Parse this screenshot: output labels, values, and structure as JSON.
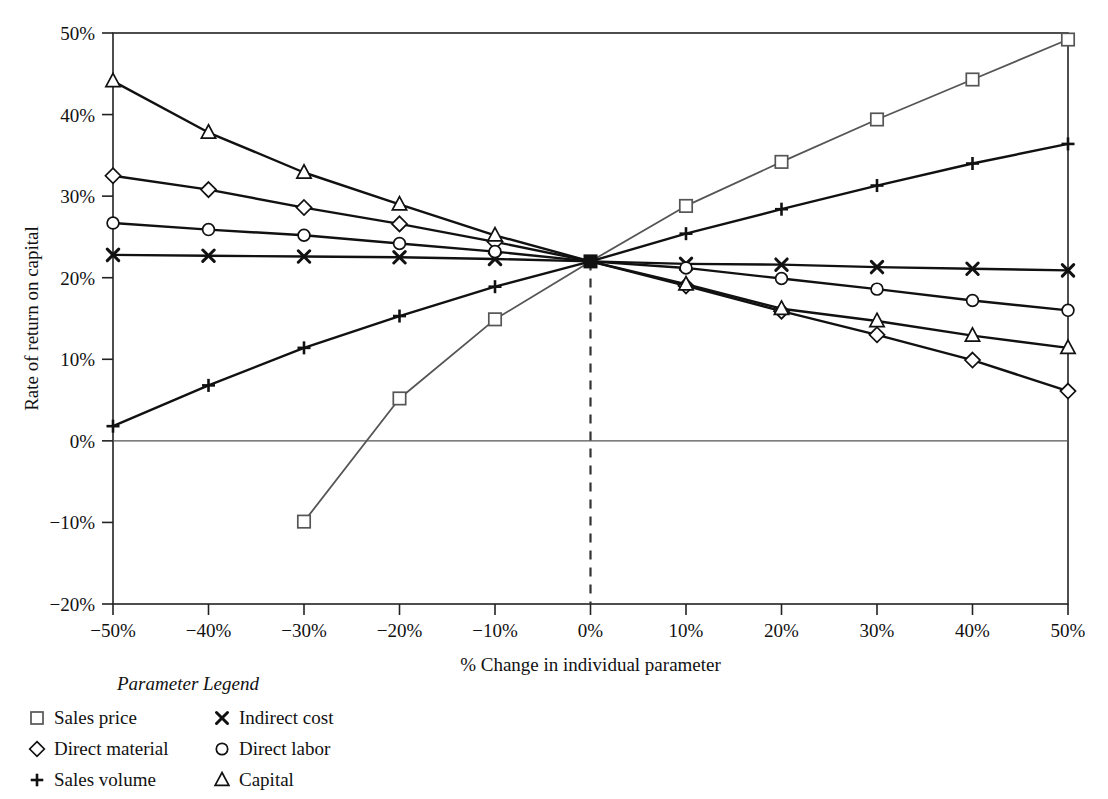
{
  "chart_data": {
    "type": "line",
    "title": "",
    "xlabel": "% Change in individual parameter",
    "ylabel": "Rate of return on capital",
    "x": [
      -50,
      -40,
      -30,
      -20,
      -10,
      0,
      10,
      20,
      30,
      40,
      50
    ],
    "xtick_labels": [
      "−50%",
      "−40%",
      "−30%",
      "−20%",
      "−10%",
      "0%",
      "10%",
      "20%",
      "30%",
      "40%",
      "50%"
    ],
    "ytick_labels": [
      "50%",
      "40%",
      "30%",
      "20%",
      "10%",
      "0%",
      "−10%",
      "−20%"
    ],
    "yticks": [
      50,
      40,
      30,
      20,
      10,
      0,
      -10,
      -20
    ],
    "xlim": [
      -50,
      50
    ],
    "ylim": [
      -20,
      50
    ],
    "grid": false,
    "legend_position": "below-left",
    "annotations": {
      "zero_reference_line_y": 0,
      "base_case_x": 0,
      "base_case_value": 22.0,
      "base_case_marker": "filled-square",
      "vertical_dashed_line_x": 0
    },
    "series": [
      {
        "name": "Sales price",
        "marker": "square",
        "color": "#555555",
        "x": [
          -30,
          -20,
          -10,
          0,
          10,
          20,
          30,
          40,
          50
        ],
        "values": [
          -9.9,
          5.2,
          14.9,
          22.0,
          28.8,
          34.2,
          39.4,
          44.3,
          49.2
        ]
      },
      {
        "name": "Direct material",
        "marker": "diamond",
        "color": "#111111",
        "x": [
          -50,
          -40,
          -30,
          -20,
          -10,
          0,
          10,
          20,
          30,
          40,
          50
        ],
        "values": [
          32.5,
          30.8,
          28.6,
          26.6,
          24.4,
          22.0,
          19.0,
          15.9,
          13.0,
          9.9,
          6.1
        ]
      },
      {
        "name": "Sales volume",
        "marker": "plus",
        "color": "#111111",
        "x": [
          -50,
          -40,
          -30,
          -20,
          -10,
          0,
          10,
          20,
          30,
          40,
          50
        ],
        "values": [
          1.8,
          6.8,
          11.4,
          15.3,
          18.9,
          22.0,
          25.4,
          28.4,
          31.3,
          34.0,
          36.4
        ]
      },
      {
        "name": "Indirect cost",
        "marker": "cross",
        "color": "#111111",
        "x": [
          -50,
          -40,
          -30,
          -20,
          -10,
          0,
          10,
          20,
          30,
          40,
          50
        ],
        "values": [
          22.8,
          22.7,
          22.6,
          22.5,
          22.3,
          22.0,
          21.7,
          21.6,
          21.3,
          21.1,
          20.9
        ]
      },
      {
        "name": "Direct labor",
        "marker": "circle",
        "color": "#111111",
        "x": [
          -50,
          -40,
          -30,
          -20,
          -10,
          0,
          10,
          20,
          30,
          40,
          50
        ],
        "values": [
          26.7,
          25.9,
          25.2,
          24.2,
          23.2,
          22.0,
          21.2,
          19.9,
          18.6,
          17.2,
          16.0
        ]
      },
      {
        "name": "Capital",
        "marker": "triangle",
        "color": "#111111",
        "x": [
          -50,
          -40,
          -30,
          -20,
          -10,
          0,
          10,
          20,
          30,
          40,
          50
        ],
        "values": [
          44.1,
          37.8,
          32.9,
          29.0,
          25.2,
          22.0,
          19.2,
          16.2,
          14.7,
          12.9,
          11.4
        ]
      }
    ]
  },
  "legend": {
    "title": "Parameter Legend",
    "columns": [
      [
        {
          "marker": "square",
          "label": "Sales price",
          "color": "#555555"
        },
        {
          "marker": "diamond",
          "label": "Direct material",
          "color": "#111111"
        },
        {
          "marker": "plus",
          "label": "Sales volume",
          "color": "#111111"
        }
      ],
      [
        {
          "marker": "cross",
          "label": "Indirect cost",
          "color": "#111111"
        },
        {
          "marker": "circle",
          "label": "Direct labor",
          "color": "#111111"
        },
        {
          "marker": "triangle",
          "label": "Capital",
          "color": "#111111"
        }
      ]
    ]
  }
}
